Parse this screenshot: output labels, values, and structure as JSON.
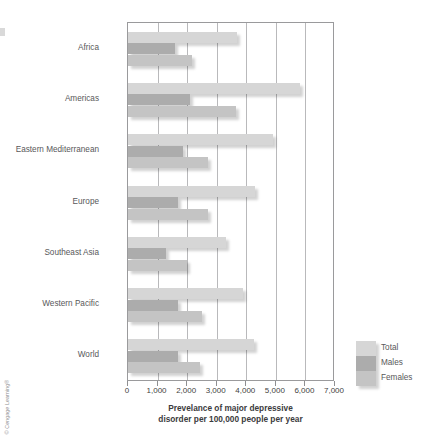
{
  "copyright": {
    "text": "© Cengage Learning®"
  },
  "chart_data": {
    "type": "bar",
    "orientation": "horizontal",
    "title": "",
    "xlabel": "Prevelance of major depressive disorder per 100,000 people per year",
    "xlabel_line1": "Prevelance of major depressive",
    "xlabel_line2": "disorder per 100,000 people per year",
    "ylabel": "",
    "xlim": [
      0,
      7000
    ],
    "xticks": [
      0,
      1000,
      2000,
      3000,
      4000,
      5000,
      6000,
      7000
    ],
    "xtick_labels": [
      "0",
      "1,000",
      "2,000",
      "3,000",
      "4,000",
      "5,000",
      "6,000",
      "7,000"
    ],
    "grid": true,
    "grid_axis": "x",
    "legend_position": "right-bottom-outside",
    "categories": [
      "Africa",
      "Americas",
      "Eastern Mediterranean",
      "Europe",
      "Southeast Asia",
      "Western Pacific",
      "World"
    ],
    "series": [
      {
        "name": "Total",
        "color": "#d6d6d6",
        "values": [
          3700,
          5800,
          4900,
          4300,
          3300,
          3900,
          4250
        ]
      },
      {
        "name": "Males",
        "color": "#acacac",
        "values": [
          1600,
          2100,
          1850,
          1700,
          1300,
          1700,
          1700
        ]
      },
      {
        "name": "Females",
        "color": "#c4c4c4",
        "values": [
          2150,
          3650,
          2700,
          2700,
          2000,
          2500,
          2450
        ]
      }
    ]
  },
  "legend": {
    "items": [
      {
        "label": "Total",
        "key": "total"
      },
      {
        "label": "Males",
        "key": "males"
      },
      {
        "label": "Females",
        "key": "females"
      }
    ]
  }
}
